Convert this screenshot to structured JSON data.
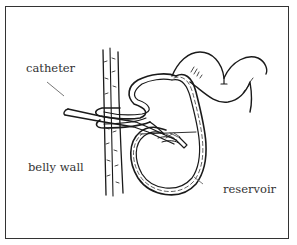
{
  "diagram": {
    "labels": {
      "catheter": "catheter",
      "belly_wall": "belly wall",
      "reservoir": "reservoir"
    },
    "colors": {
      "line": "#1a1a1a",
      "label_text": "#333333",
      "leader_line": "#555555",
      "frame": "#333333",
      "background": "#ffffff"
    }
  }
}
